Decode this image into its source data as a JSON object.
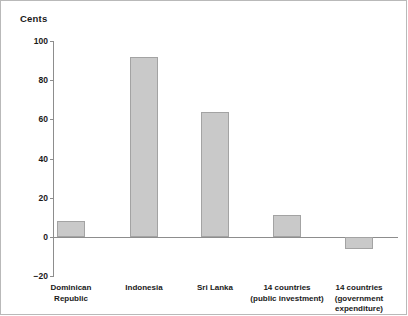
{
  "chart_data": {
    "type": "bar",
    "title": "Cents",
    "xlabel": "",
    "ylabel": "Cents",
    "categories": [
      "Dominican\nRepublic",
      "Indonesia",
      "Sri Lanka",
      "14 countries\n(public investment)",
      "14 countries\n(government\nexpenditure)"
    ],
    "values": [
      8,
      92,
      64,
      11,
      -6
    ],
    "ylim": [
      -20,
      100
    ],
    "yticks": [
      100,
      80,
      60,
      40,
      20,
      0,
      -20
    ],
    "ytick_labels": [
      "100",
      "80",
      "60",
      "40",
      "20",
      "0",
      "−20"
    ],
    "grid": false,
    "legend": "none",
    "bar_color": "#c9c9c9",
    "bar_border_color": "#a3a3a3",
    "axis_color": "#8d8d8d",
    "text_color": "#1a1a1a",
    "background": "#ffffff"
  }
}
